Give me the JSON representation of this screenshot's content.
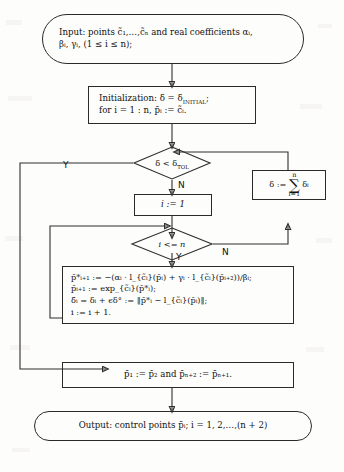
{
  "diagram": {
    "type": "flowchart"
  },
  "nodes": {
    "input": {
      "shape": "terminator",
      "line1": "Input:  points c̃₁,…,c̃ₙ and real coefficients αᵢ,",
      "line2": "βᵢ, γᵢ, (1 ≤ i ≤ n);"
    },
    "init": {
      "shape": "process",
      "line1": "Initialization:  δ = δ",
      "line1_sub": "INITIAL",
      "line1_end": ";",
      "line2": "for i = 1 : n, p̄ᵢ := c̃ᵢ."
    },
    "decision_tol": {
      "shape": "decision",
      "label": "δ < δ",
      "label_sub": "TOL",
      "yes": "Y",
      "no": "N"
    },
    "set_i": {
      "shape": "process",
      "text": "i := 1"
    },
    "decision_i": {
      "shape": "decision",
      "label": "i <= n",
      "yes": "Y",
      "no": "N"
    },
    "sum_delta": {
      "shape": "process",
      "lhs": "δ :=",
      "sum_top": "n",
      "sum_sym": "∑",
      "sum_bot": "i=1",
      "rhs": "δᵢ"
    },
    "compute": {
      "shape": "process",
      "line1": "p̄*ᵢ₊₁ := −(αᵢ · l_{c̃ᵢ}(p̄ᵢ) + γᵢ · l_{c̃ᵢ}(p̄ᵢ₊₂))/βᵢ;",
      "line2": "p̄ᵢ₊₁ := exp_{c̃ᵢ}(p̄*ᵢ);",
      "line3": "δ̄ᵢ = δᵢ + ϵδ° := ‖p̄*ᵢ − l_{c̃ᵢ}(p̄ᵢ)‖;",
      "line4": "i := i + 1."
    },
    "endpoints": {
      "shape": "process",
      "text": "p̄₁ := p̄₂ and p̄ₙ₊₂ := p̄ₙ₊₁."
    },
    "output": {
      "shape": "terminator",
      "text": "Output:  control points p̄ᵢ; i = 1, 2,…,(n + 2)"
    }
  },
  "edge_labels": {
    "tol_yes": "Y",
    "tol_no": "N",
    "loop_yes": "Y",
    "loop_no": "N"
  },
  "colors": {
    "stroke": "#2f2f2f",
    "text": "#111111",
    "paper": "#fdfdfc"
  }
}
